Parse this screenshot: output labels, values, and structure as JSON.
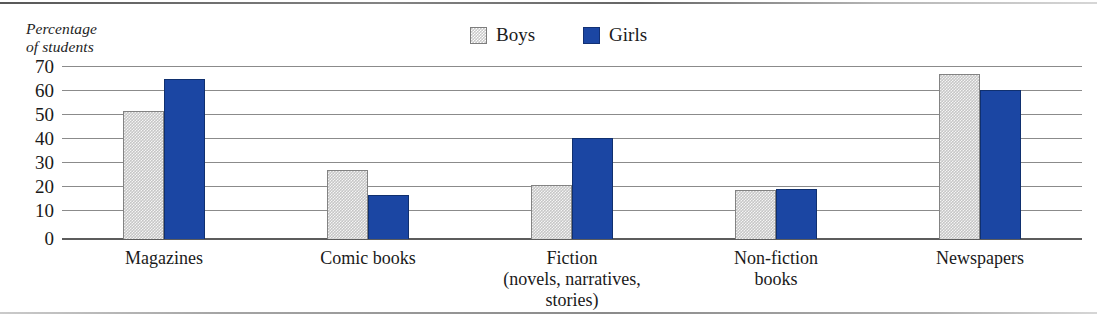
{
  "chart_data": {
    "type": "bar",
    "title": "",
    "subtitle": "",
    "xlabel": "",
    "ylabel": "Percentage\nof students",
    "ylim": [
      0,
      70
    ],
    "yticks": [
      70,
      60,
      50,
      40,
      30,
      20,
      10,
      0
    ],
    "grid": true,
    "legend_position": "top-center",
    "categories": [
      "Magazines",
      "Comic books",
      "Fiction\n(novels, narratives,\nstories)",
      "Non-fiction\nbooks",
      "Newspapers"
    ],
    "series": [
      {
        "name": "Boys",
        "color": "#c6c6c6",
        "values": [
          52,
          28,
          22,
          20,
          67
        ]
      },
      {
        "name": "Girls",
        "color": "#1b46a3",
        "values": [
          65,
          18,
          41,
          20.5,
          60.5
        ]
      }
    ]
  },
  "axis": {
    "y_title": "Percentage\nof students",
    "ticks": [
      "70",
      "60",
      "50",
      "40",
      "30",
      "20",
      "10",
      "0"
    ]
  },
  "legend": {
    "items": [
      {
        "label": "Boys",
        "swatch": "boys-swatch-icon"
      },
      {
        "label": "Girls",
        "swatch": "girls-swatch-icon"
      }
    ]
  },
  "categories": [
    {
      "label": "Magazines"
    },
    {
      "label": "Comic books"
    },
    {
      "label": "Fiction\n(novels, narratives,\nstories)"
    },
    {
      "label": "Non-fiction\nbooks"
    },
    {
      "label": "Newspapers"
    }
  ],
  "colors": {
    "boys": "#c6c6c6",
    "girls": "#1b46a3",
    "gridline": "#8b8b8b",
    "baseline": "#5c5c5c",
    "text": "#1a1a1a"
  }
}
